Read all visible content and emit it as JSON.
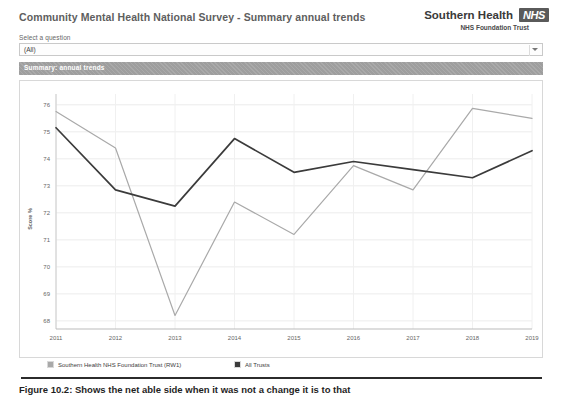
{
  "header": {
    "title": "Community Mental Health National Survey - Summary annual trends",
    "brand_name": "Southern Health",
    "brand_logo": "NHS",
    "brand_sub": "NHS Foundation Trust"
  },
  "filter": {
    "label": "Select a question",
    "value": "(All)",
    "placeholder": "(All)",
    "caret_icon": "chevron-down-icon"
  },
  "section": {
    "title": "Summary: annual trends"
  },
  "legend": [
    {
      "label": "Southern Health NHS Foundation Trust (RW1)",
      "color": "#a9a9a9"
    },
    {
      "label": "All Trusts",
      "color": "#3b3b3b"
    }
  ],
  "caption": {
    "text": "Figure 10.2:  Shows the net able side when it was not a change it is to that"
  },
  "chart_data": {
    "type": "line",
    "title": "Summary: annual trends",
    "xlabel": "",
    "ylabel": "Score %",
    "x": [
      "2011",
      "2012",
      "2013",
      "2014",
      "2015",
      "2016",
      "2017",
      "2018",
      "2019"
    ],
    "yticks": [
      68,
      69,
      70,
      71,
      72,
      73,
      74,
      75,
      76
    ],
    "ylim": [
      67.7,
      76.4
    ],
    "grid": true,
    "legend_position": "bottom",
    "series": [
      {
        "name": "Southern Health NHS Foundation Trust (RW1)",
        "color": "#a9a9a9",
        "values": [
          75.75,
          74.4,
          68.2,
          72.4,
          71.2,
          73.75,
          72.85,
          75.87,
          75.5
        ]
      },
      {
        "name": "All Trusts",
        "color": "#3b3b3b",
        "values": [
          75.15,
          72.85,
          72.25,
          74.75,
          73.5,
          73.9,
          73.6,
          73.3,
          74.3
        ]
      }
    ]
  }
}
